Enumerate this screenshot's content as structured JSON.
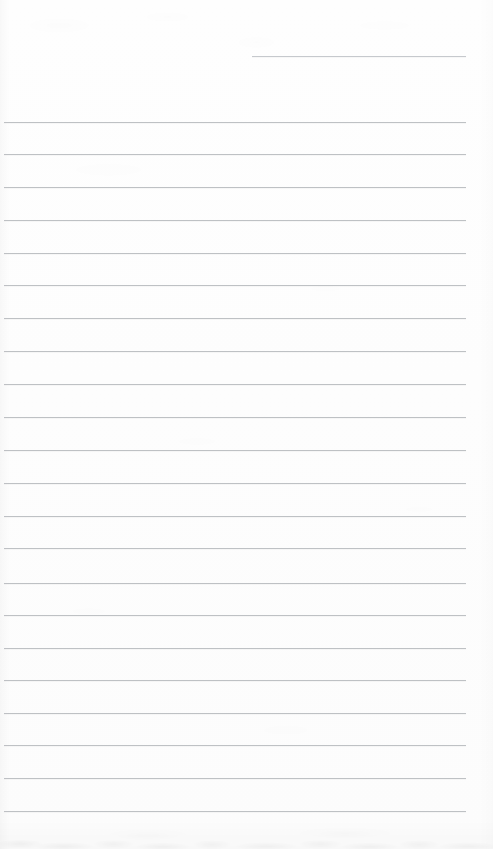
{
  "document": {
    "kind": "scanned-lined-notepad-page",
    "title": "Blank lined notepad page",
    "content_text": "",
    "page_width": 493,
    "page_height": 849,
    "paper_color": "#fdfdfd",
    "rule_color": "#b9bcc0",
    "rule_thickness": 1,
    "rule_count": 23,
    "full_rule_count": 22,
    "partial_rule_count": 1,
    "rule_spacing": 32.7,
    "left_margin": 4,
    "right_margin": 27,
    "has_vertical_margin_rule": false,
    "has_handwriting": false,
    "has_printed_text": false,
    "bottom_shadow_band_height": 34
  },
  "rules": [
    {
      "id": "rule-partial-1",
      "y": 56,
      "x": 252,
      "width": 214,
      "partial": true
    },
    {
      "id": "rule-1",
      "y": 122,
      "x": 4,
      "width": 462,
      "partial": false
    },
    {
      "id": "rule-2",
      "y": 154,
      "x": 4,
      "width": 462,
      "partial": false
    },
    {
      "id": "rule-3",
      "y": 187,
      "x": 4,
      "width": 462,
      "partial": false
    },
    {
      "id": "rule-4",
      "y": 220,
      "x": 4,
      "width": 462,
      "partial": false
    },
    {
      "id": "rule-5",
      "y": 253,
      "x": 4,
      "width": 462,
      "partial": false
    },
    {
      "id": "rule-6",
      "y": 285,
      "x": 4,
      "width": 462,
      "partial": false
    },
    {
      "id": "rule-7",
      "y": 318,
      "x": 4,
      "width": 462,
      "partial": false
    },
    {
      "id": "rule-8",
      "y": 351,
      "x": 4,
      "width": 462,
      "partial": false
    },
    {
      "id": "rule-9",
      "y": 384,
      "x": 4,
      "width": 462,
      "partial": false
    },
    {
      "id": "rule-10",
      "y": 417,
      "x": 4,
      "width": 462,
      "partial": false
    },
    {
      "id": "rule-11",
      "y": 450,
      "x": 4,
      "width": 462,
      "partial": false
    },
    {
      "id": "rule-12",
      "y": 483,
      "x": 4,
      "width": 462,
      "partial": false
    },
    {
      "id": "rule-13",
      "y": 516,
      "x": 4,
      "width": 462,
      "partial": false
    },
    {
      "id": "rule-14",
      "y": 548,
      "x": 4,
      "width": 462,
      "partial": false
    },
    {
      "id": "rule-15",
      "y": 583,
      "x": 4,
      "width": 462,
      "partial": false
    },
    {
      "id": "rule-16",
      "y": 615,
      "x": 4,
      "width": 462,
      "partial": false
    },
    {
      "id": "rule-17",
      "y": 648,
      "x": 4,
      "width": 462,
      "partial": false
    },
    {
      "id": "rule-18",
      "y": 680,
      "x": 4,
      "width": 462,
      "partial": false
    },
    {
      "id": "rule-19",
      "y": 713,
      "x": 4,
      "width": 462,
      "partial": false
    },
    {
      "id": "rule-20",
      "y": 745,
      "x": 4,
      "width": 462,
      "partial": false
    },
    {
      "id": "rule-21",
      "y": 778,
      "x": 4,
      "width": 462,
      "partial": false
    },
    {
      "id": "rule-22",
      "y": 811,
      "x": 4,
      "width": 462,
      "partial": false
    }
  ]
}
